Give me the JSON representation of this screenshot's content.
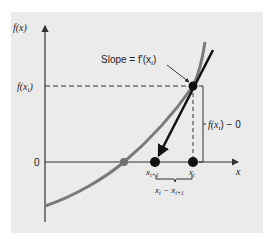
{
  "figure": {
    "y_axis_label": "f(x)",
    "x_axis_label": "x",
    "y_tick_fxi": "f(x",
    "y_tick_fxi_sub": "i",
    "y_tick_fxi_close": ")",
    "y_tick_zero": "0",
    "slope_label": "Slope = f′(x",
    "slope_label_sub": "i",
    "slope_label_close": ")",
    "rise_label": "f(x",
    "rise_label_sub": "i",
    "rise_label_tail": ") − 0",
    "point_xi_label": "x",
    "point_xi_sub": "i",
    "point_xi1_label": "x",
    "point_xi1_sub": "i+1",
    "run_label_a": "x",
    "run_label_a_sub": "i",
    "run_label_mid": " − x",
    "run_label_b_sub": "i+1",
    "colors": {
      "background": "#ebebeb",
      "curve": "#7a7a7a",
      "tangent": "#111111",
      "root_point": "#707070",
      "axis": "#333333"
    }
  }
}
